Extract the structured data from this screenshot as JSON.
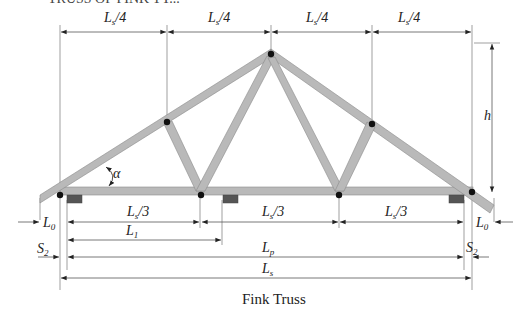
{
  "top_fragment": "TRUSS OF FINK TY...",
  "caption": "Fink Truss",
  "dimensions": {
    "top": [
      "L_s/4",
      "L_s/4",
      "L_s/4",
      "L_s/4"
    ],
    "bottom_thirds": [
      "L_s/3",
      "L_s/3",
      "L_s/3"
    ],
    "height": "h",
    "overhang_left": "L_0",
    "overhang_right": "L_0",
    "l1": "L_1",
    "support_offset_left": "S_2",
    "support_offset_right": "S_2",
    "lp": "L_p",
    "ls": "L_s",
    "angle": "α"
  },
  "labels": {
    "L": "L",
    "s_sub": "s",
    "slash4": "/4",
    "slash3": "/3",
    "zero_sub": "0",
    "one_sub": "1",
    "p_sub": "p",
    "two_sub": "2",
    "S": "S",
    "h": "h",
    "alpha": "α"
  },
  "colors": {
    "member_fill": "#b9b9b9",
    "member_stroke": "#8a8a8a",
    "joint": "#111111",
    "bearing": "#555555",
    "dimension_line": "#555555"
  }
}
